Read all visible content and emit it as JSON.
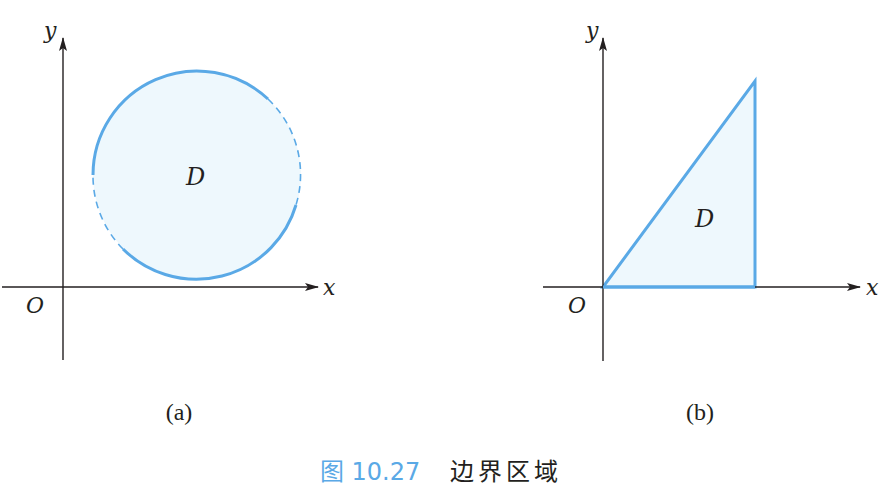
{
  "figure": {
    "colors": {
      "region_stroke": "#5aa9e6",
      "region_fill": "#eef8fd",
      "axis": "#231f20",
      "caption_number": "#5aa9e6"
    },
    "panel_a": {
      "label": "(a)",
      "x_axis_label": "x",
      "y_axis_label": "y",
      "origin_label": "O",
      "region_label": "D",
      "shape": "circle",
      "boundary": "partially solid, partially dashed (dashed arcs on left-lower and right sides)"
    },
    "panel_b": {
      "label": "(b)",
      "x_axis_label": "x",
      "y_axis_label": "y",
      "origin_label": "O",
      "region_label": "D",
      "shape": "right triangle with vertex at origin",
      "boundary": "solid"
    },
    "caption": {
      "number": "图 10.27",
      "title": "边界区域"
    }
  }
}
